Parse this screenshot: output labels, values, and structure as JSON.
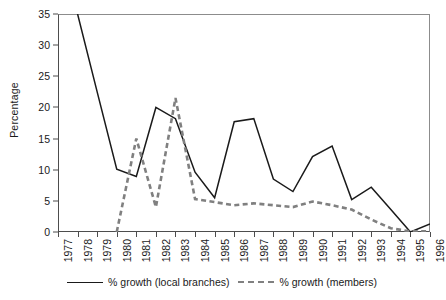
{
  "chart_data": {
    "type": "line",
    "title": "",
    "xlabel": "",
    "ylabel": "Percentage",
    "ylim": [
      0,
      35
    ],
    "ytick_values": [
      0,
      5,
      10,
      15,
      20,
      25,
      30,
      35
    ],
    "grid": false,
    "legend_position": "bottom",
    "x": [
      1977,
      1978,
      1979,
      1980,
      1981,
      1982,
      1983,
      1984,
      1985,
      1986,
      1987,
      1988,
      1989,
      1990,
      1991,
      1992,
      1993,
      1994,
      1995,
      1996
    ],
    "xtick_labels": [
      "1977",
      "1978",
      "1979",
      "1980",
      "1981",
      "1982",
      "1983",
      "1984",
      "1985",
      "1986",
      "1987",
      "1988",
      "1989",
      "1990",
      "1991",
      "1992",
      "1993",
      "1994",
      "1995",
      "1996"
    ],
    "series": [
      {
        "name": "% growth (local branches)",
        "style": "solid",
        "color": "#1a1a1a",
        "x": [
          1978,
          1979,
          1980,
          1981,
          1982,
          1983,
          1984,
          1985,
          1986,
          1987,
          1988,
          1989,
          1990,
          1991,
          1992,
          1993,
          1994,
          1995,
          1996
        ],
        "values": [
          35,
          22.5,
          10.1,
          8.9,
          20.0,
          18.2,
          9.6,
          5.5,
          17.7,
          18.2,
          8.5,
          6.5,
          12.1,
          13.8,
          5.2,
          7.2,
          3.6,
          0.0,
          1.3
        ],
        "note_clipped_at_top": "1978 value is clipped by the 35% axis maximum"
      },
      {
        "name": "% growth (members)",
        "style": "dashed",
        "color": "#808080",
        "x": [
          1980,
          1981,
          1982,
          1983,
          1984,
          1985,
          1986,
          1987,
          1988,
          1989,
          1990,
          1991,
          1992,
          1993,
          1994,
          1995,
          1996
        ],
        "values": [
          0.0,
          15.0,
          4.0,
          21.5,
          5.3,
          4.8,
          4.3,
          4.6,
          4.3,
          4.0,
          4.9,
          4.3,
          3.6,
          2.0,
          0.6,
          0.1,
          0.1
        ]
      }
    ]
  },
  "legend": {
    "items": [
      {
        "label": "% growth (local branches)",
        "marker": "solid-line-swatch"
      },
      {
        "label": "% growth (members)",
        "marker": "dashed-line-swatch"
      }
    ]
  },
  "axes": {
    "y_title": "Percentage"
  }
}
